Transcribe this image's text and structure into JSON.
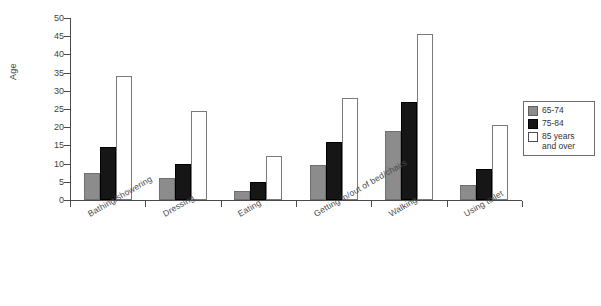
{
  "chart_data": {
    "type": "bar",
    "title": "",
    "xlabel": "",
    "ylabel": "Age",
    "ylim": [
      0,
      50
    ],
    "yticks": [
      0,
      5,
      10,
      15,
      20,
      25,
      30,
      35,
      40,
      45,
      50
    ],
    "grid": false,
    "legend_position": "right",
    "categories": [
      "Bathing/showering",
      "Dressing",
      "Eating",
      "Getting in/out of bed/chairs",
      "Walking",
      "Using toilet"
    ],
    "series": [
      {
        "name": "65-74",
        "color": "#8c8c8c",
        "values": [
          7.5,
          6,
          2.5,
          9.5,
          19,
          4
        ]
      },
      {
        "name": "75-84",
        "color": "#161616",
        "values": [
          14.5,
          10,
          5,
          16,
          27,
          8.5
        ]
      },
      {
        "name": "85 years and over",
        "color": "#ffffff",
        "values": [
          34,
          24.5,
          12,
          28,
          45.5,
          20.5
        ]
      }
    ]
  },
  "legend": {
    "items": [
      {
        "label": "65-74",
        "label2": ""
      },
      {
        "label": "75-84",
        "label2": ""
      },
      {
        "label": "85 years",
        "label2": "and over"
      }
    ]
  },
  "caption": {
    "text": ""
  }
}
